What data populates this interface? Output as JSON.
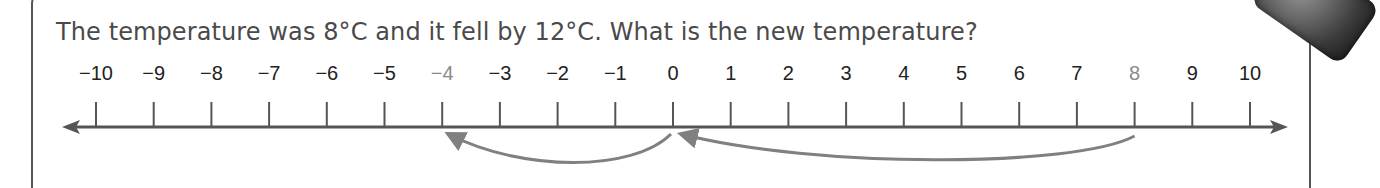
{
  "question": {
    "text": "The temperature was 8°C and it fell by 12°C. What is the new temperature?"
  },
  "number_line": {
    "min": -10,
    "max": 10,
    "step": 1,
    "labels": [
      "−10",
      "−9",
      "−8",
      "−7",
      "−6",
      "−5",
      "−4",
      "−3",
      "−2",
      "−1",
      "0",
      "1",
      "2",
      "3",
      "4",
      "5",
      "6",
      "7",
      "8",
      "9",
      "10"
    ],
    "highlighted_values": [
      -4,
      8
    ],
    "start_value": 8,
    "change": -12,
    "end_value": -4,
    "jumps": [
      {
        "from": 8,
        "to": 0,
        "label": ""
      },
      {
        "from": 0,
        "to": -4,
        "label": ""
      }
    ]
  },
  "colors": {
    "text": "#4a4a4a",
    "axis": "#555555",
    "tick_label": "#222222",
    "highlight_label": "#8a8a8a",
    "jump_arrow": "#808080"
  },
  "chart_data": {
    "type": "number_line",
    "title": "The temperature was 8°C and it fell by 12°C. What is the new temperature?",
    "xlim": [
      -10,
      10
    ],
    "ticks": [
      -10,
      -9,
      -8,
      -7,
      -6,
      -5,
      -4,
      -3,
      -2,
      -1,
      0,
      1,
      2,
      3,
      4,
      5,
      6,
      7,
      8,
      9,
      10
    ],
    "highlighted": [
      -4,
      8
    ],
    "arrows": [
      {
        "from": 8,
        "to": 0
      },
      {
        "from": 0,
        "to": -4
      }
    ]
  }
}
